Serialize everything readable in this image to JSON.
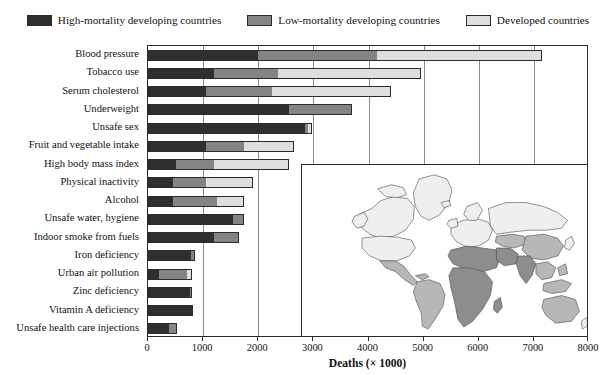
{
  "legend": {
    "position": "top",
    "items": [
      {
        "label": "High-mortality developing countries",
        "color": "#2f2f2f",
        "key": "high"
      },
      {
        "label": "Low-mortality developing countries",
        "color": "#848484",
        "key": "low"
      },
      {
        "label": "Developed countries",
        "color": "#dedede",
        "key": "dev"
      }
    ]
  },
  "axis": {
    "x_title": "Deaths (× 1000)",
    "ticks": [
      "0",
      "1000",
      "2000",
      "3000",
      "4000",
      "5000",
      "6000",
      "7000",
      "8000"
    ]
  },
  "inset": {
    "name": "world-map-inset",
    "description": "World map shaded by country mortality stratum",
    "colors": {
      "developed": "#efefef",
      "low_mortality": "#b7b7b7",
      "high_mortality": "#8d8d8d"
    }
  },
  "chart_data": {
    "type": "bar",
    "orientation": "horizontal",
    "stacked": true,
    "title": "",
    "xlabel": "Deaths (× 1000)",
    "ylabel": "",
    "xlim": [
      0,
      8000
    ],
    "xticks": [
      0,
      1000,
      2000,
      3000,
      4000,
      5000,
      6000,
      7000,
      8000
    ],
    "grid": "vertical",
    "legend_position": "top",
    "categories": [
      "Blood pressure",
      "Tobacco use",
      "Serum cholesterol",
      "Underweight",
      "Unsafe sex",
      "Fruit and vegetable intake",
      "High body mass index",
      "Physical inactivity",
      "Alcohol",
      "Unsafe water, hygiene",
      "Indoor smoke from fuels",
      "Iron deficiency",
      "Urban air pollution",
      "Zinc deficiency",
      "Vitamin A deficiency",
      "Unsafe health care injections"
    ],
    "series": [
      {
        "name": "High-mortality developing countries",
        "color": "#2f2f2f",
        "values": [
          2000,
          1200,
          1050,
          2550,
          2850,
          1050,
          500,
          450,
          450,
          1550,
          1200,
          780,
          200,
          760,
          790,
          380
        ]
      },
      {
        "name": "Low-mortality developing countries",
        "color": "#848484",
        "values": [
          2150,
          1150,
          1200,
          1150,
          60,
          700,
          700,
          600,
          800,
          200,
          450,
          70,
          500,
          40,
          10,
          140
        ]
      },
      {
        "name": "Developed countries",
        "color": "#dedede",
        "values": [
          3000,
          2600,
          2150,
          0,
          60,
          900,
          1350,
          850,
          500,
          0,
          0,
          0,
          100,
          0,
          0,
          0
        ]
      }
    ],
    "totals": [
      7150,
      4950,
      4400,
      3700,
      2970,
      2650,
      2550,
      1900,
      1750,
      1750,
      1650,
      850,
      800,
      800,
      800,
      520
    ]
  }
}
